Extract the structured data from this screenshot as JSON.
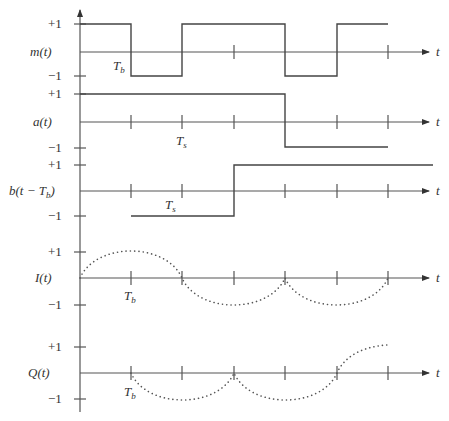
{
  "diagram": {
    "type": "timing-diagram",
    "axis_label": "t",
    "panels": [
      {
        "name": "m",
        "label": "m(t)",
        "plus_label": "+1",
        "minus_label": "−1",
        "annotation": "T",
        "annotation_sub": "b",
        "waveform": "square",
        "levels": [
          1,
          -1,
          1,
          -1,
          1
        ],
        "transitions_at_ticks": [
          1,
          2,
          4,
          5
        ]
      },
      {
        "name": "a",
        "label": "a(t)",
        "plus_label": "+1",
        "minus_label": "−1",
        "annotation": "T",
        "annotation_sub": "s",
        "waveform": "square",
        "levels": [
          1,
          -1
        ],
        "transitions_at_ticks": [
          4
        ]
      },
      {
        "name": "b",
        "label": "b(t − T",
        "label_sub": "b",
        "label_end": ")",
        "plus_label": "+1",
        "minus_label": "−1",
        "annotation": "T",
        "annotation_sub": "s",
        "waveform": "square",
        "levels": [
          -1,
          1
        ],
        "transitions_at_ticks": [
          3
        ]
      },
      {
        "name": "I",
        "label": "I(t)",
        "plus_label": "+1",
        "minus_label": "−1",
        "annotation": "T",
        "annotation_sub": "b",
        "waveform": "dotted-half-sinusoid"
      },
      {
        "name": "Q",
        "label": "Q(t)",
        "plus_label": "+1",
        "minus_label": "−1",
        "annotation": "T",
        "annotation_sub": "b",
        "waveform": "dotted-half-sinusoid"
      }
    ]
  }
}
